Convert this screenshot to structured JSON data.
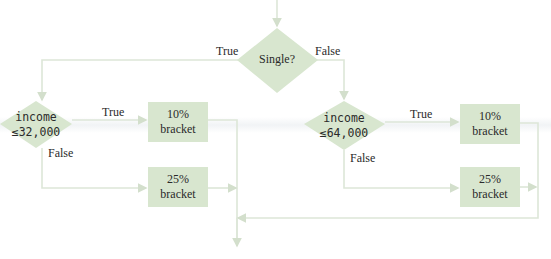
{
  "colors": {
    "shape_fill": "#d8e6cf",
    "line": "#dde6d8",
    "text": "#2a2a2a"
  },
  "nodes": {
    "single": {
      "text": "Single?"
    },
    "income_single": {
      "line1": "income",
      "line2": "≤32,000"
    },
    "income_married": {
      "line1": "income",
      "line2": "≤64,000"
    },
    "bracket_10_left": {
      "line1": "10%",
      "line2": "bracket"
    },
    "bracket_25_left": {
      "line1": "25%",
      "line2": "bracket"
    },
    "bracket_10_right": {
      "line1": "10%",
      "line2": "bracket"
    },
    "bracket_25_right": {
      "line1": "25%",
      "line2": "bracket"
    }
  },
  "edge_labels": {
    "single_true": "True",
    "single_false": "False",
    "income_single_true": "True",
    "income_single_false": "False",
    "income_married_true": "True",
    "income_married_false": "False"
  }
}
